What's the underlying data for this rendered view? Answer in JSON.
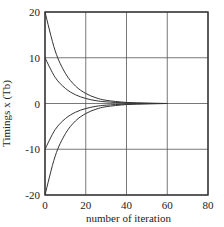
{
  "chart_data": {
    "type": "line",
    "title": "",
    "xlabel": "number of iteration",
    "ylabel": "Timings x (Tb)",
    "xlim": [
      0,
      80
    ],
    "ylim": [
      -20,
      20
    ],
    "xticks": [
      0,
      20,
      40,
      60,
      80
    ],
    "yticks": [
      -20,
      -10,
      0,
      10,
      20
    ],
    "xtick_labels": [
      "0",
      "20",
      "40",
      "60",
      "80"
    ],
    "ytick_labels": [
      "-20",
      "-10",
      "0",
      "10",
      "20"
    ],
    "grid": true,
    "legend": "none",
    "series": [
      {
        "name": "start 20",
        "x": [
          0,
          5,
          10,
          15,
          20,
          25,
          30,
          40,
          50,
          60
        ],
        "y": [
          20,
          11.5,
          6.6,
          3.8,
          2.2,
          1.25,
          0.7,
          0.23,
          0.08,
          0.0
        ]
      },
      {
        "name": "start 10",
        "x": [
          0,
          5,
          10,
          15,
          20,
          25,
          30,
          40,
          50,
          60
        ],
        "y": [
          10,
          5.7,
          3.3,
          1.9,
          1.1,
          0.62,
          0.36,
          0.12,
          0.04,
          0.0
        ]
      },
      {
        "name": "start -10",
        "x": [
          0,
          5,
          10,
          15,
          20,
          25,
          30,
          40,
          50,
          60
        ],
        "y": [
          -10,
          -5.7,
          -3.3,
          -1.9,
          -1.1,
          -0.62,
          -0.36,
          -0.12,
          -0.04,
          0.0
        ]
      },
      {
        "name": "start -20",
        "x": [
          0,
          5,
          10,
          15,
          20,
          25,
          30,
          40,
          50,
          60
        ],
        "y": [
          -20,
          -11.5,
          -6.6,
          -3.8,
          -2.2,
          -1.25,
          -0.7,
          -0.23,
          -0.08,
          0.0
        ]
      }
    ]
  }
}
